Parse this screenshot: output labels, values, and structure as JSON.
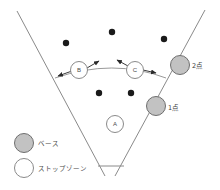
{
  "diagram": {
    "field": {
      "left_edge": {
        "x1": 17,
        "y1": 11,
        "x2": 105,
        "y2": 176
      },
      "right_edge": {
        "x1": 205,
        "y1": 10,
        "x2": 115,
        "y2": 176
      },
      "apex_bar": {
        "x1": 98,
        "y1": 166,
        "x2": 124,
        "y2": 166
      }
    },
    "arc": {
      "name": "movement-arc",
      "d": "M 55 78 Q 113 58 166 78"
    },
    "stop_zones": [
      {
        "id": "B",
        "label": "B",
        "cx": 79,
        "cy": 70,
        "r": 8.5
      },
      {
        "id": "C",
        "label": "C",
        "cx": 135,
        "cy": 70,
        "r": 8.5
      },
      {
        "id": "A",
        "label": "A",
        "cx": 115,
        "cy": 124,
        "r": 8.5
      }
    ],
    "bases": [
      {
        "id": "base-2",
        "label": "2点",
        "cx": 180,
        "cy": 65,
        "r": 9.5,
        "label_x": 192,
        "label_y": 66
      },
      {
        "id": "base-1",
        "label": "1点",
        "cx": 156,
        "cy": 106,
        "r": 9.5,
        "label_x": 168,
        "label_y": 108
      }
    ],
    "players": [
      {
        "cx": 112,
        "cy": 32,
        "r": 3.2
      },
      {
        "cx": 66,
        "cy": 43,
        "r": 3.2
      },
      {
        "cx": 164,
        "cy": 39,
        "r": 3.2
      },
      {
        "cx": 99,
        "cy": 93,
        "r": 3.2
      },
      {
        "cx": 131,
        "cy": 93,
        "r": 3.2
      }
    ],
    "arrows": [
      {
        "name": "arrow-b-left",
        "x1": 72,
        "y1": 71,
        "x2": 58,
        "y2": 76
      },
      {
        "name": "arrow-b-right",
        "x1": 87,
        "y1": 68,
        "x2": 99,
        "y2": 61
      },
      {
        "name": "arrow-c-left",
        "x1": 128,
        "y1": 66,
        "x2": 117,
        "y2": 60
      },
      {
        "name": "arrow-c-right",
        "x1": 143,
        "y1": 70,
        "x2": 156,
        "y2": 73
      }
    ],
    "legend": {
      "items": [
        {
          "id": "legend-base",
          "swatch": "base",
          "label": "ベース",
          "cx": 24,
          "cy": 143,
          "r": 9.5,
          "text_x": 38,
          "text_y": 144
        },
        {
          "id": "legend-stop-zone",
          "swatch": "stop",
          "label": "ストップゾーン",
          "cx": 24,
          "cy": 168,
          "r": 9.5,
          "text_x": 38,
          "text_y": 169
        }
      ]
    },
    "colors": {
      "base_fill": "#c2c2c2",
      "base_stroke": "#6e6e6e",
      "stop_fill": "#ffffff",
      "stop_stroke": "#8a8a8a",
      "player_fill": "#1a1a1a",
      "field_stroke": "#8a8a8a",
      "arc_stroke": "#9a9a9a",
      "arrow_stroke": "#3a3a3a"
    }
  }
}
